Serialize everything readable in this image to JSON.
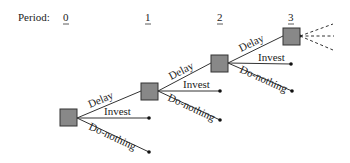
{
  "header": {
    "period_label": "Period:",
    "periods": [
      "0",
      "1",
      "2",
      "3"
    ]
  },
  "actions": {
    "delay": "Delay",
    "invest": "Invest",
    "do_nothing": "Do-nothing"
  },
  "colors": {
    "node_fill": "#888888",
    "node_stroke": "#333333",
    "line": "#333333",
    "text": "#222222",
    "background": "#ffffff"
  },
  "tree": {
    "nodes": [
      {
        "period": "0",
        "x": 60,
        "y": 109,
        "size": 17
      },
      {
        "period": "1",
        "x": 141,
        "y": 83,
        "size": 17
      },
      {
        "period": "2",
        "x": 211,
        "y": 55,
        "size": 17
      },
      {
        "period": "3",
        "x": 283,
        "y": 28,
        "size": 17
      }
    ],
    "continuation": "dashed-branches"
  }
}
